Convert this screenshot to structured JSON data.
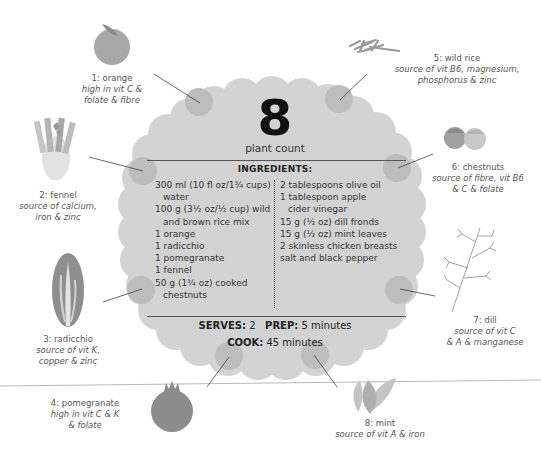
{
  "plant_count": {
    "number": "8",
    "label": "plant count"
  },
  "ingredients": {
    "title": "INGREDIENTS:",
    "left": [
      {
        "text": "300 ml (10 fl oz/1¾ cups)",
        "indent": false
      },
      {
        "text": "water",
        "indent": true
      },
      {
        "text": "100 g (3½ oz/½ cup) wild",
        "indent": false
      },
      {
        "text": "and brown rice mix",
        "indent": true
      },
      {
        "text": "1 orange",
        "indent": false
      },
      {
        "text": "1 radicchio",
        "indent": false
      },
      {
        "text": "1 pomegranate",
        "indent": false
      },
      {
        "text": "1 fennel",
        "indent": false
      },
      {
        "text": "50 g (1¾ oz) cooked",
        "indent": false
      },
      {
        "text": "chestnuts",
        "indent": true
      }
    ],
    "right": [
      {
        "text": "2 tablespoons olive oil",
        "indent": false
      },
      {
        "text": "1 tablespoon apple",
        "indent": false
      },
      {
        "text": "cider vinegar",
        "indent": true
      },
      {
        "text": "15 g (½ oz) dill fronds",
        "indent": false
      },
      {
        "text": "15 g (½ oz) mint leaves",
        "indent": false
      },
      {
        "text": "2 skinless chicken breasts",
        "indent": false
      },
      {
        "text": "salt and black pepper",
        "indent": false
      }
    ]
  },
  "meta": {
    "serves_label": "SERVES:",
    "serves_value": "2",
    "prep_label": "PREP:",
    "prep_value": "5 minutes",
    "cook_label": "COOK:",
    "cook_value": "45 minutes"
  },
  "plants": [
    {
      "name": "1: orange",
      "desc1": "high in vit C &",
      "desc2": "folate & fibre",
      "icon": "orange-icon"
    },
    {
      "name": "2: fennel",
      "desc1": "source of calcium,",
      "desc2": "iron & zinc",
      "icon": "fennel-icon"
    },
    {
      "name": "3: radicchio",
      "desc1": "source of vit K,",
      "desc2": "copper & zinc",
      "icon": "radicchio-icon"
    },
    {
      "name": "4: pomegranate",
      "desc1": "high in vit C & K",
      "desc2": "& folate",
      "icon": "pomegranate-icon"
    },
    {
      "name": "5: wild rice",
      "desc1": "source of vit B6, magnesium,",
      "desc2": "phosphorus & zinc",
      "icon": "wild-rice-icon"
    },
    {
      "name": "6: chestnuts",
      "desc1": "source of fibre, vit B6",
      "desc2": "& C & folate",
      "icon": "chestnuts-icon"
    },
    {
      "name": "7: dill",
      "desc1": "source of vit C",
      "desc2": "& A & manganese",
      "icon": "dill-icon"
    },
    {
      "name": "8: mint",
      "desc1": "source of vit A & iron",
      "desc2": "",
      "icon": "mint-icon"
    }
  ],
  "colors": {
    "blob": "#d3d3d3",
    "marker": "#bdbdbd",
    "text": "#333333",
    "illustration_dark": "#9a9a9a",
    "illustration_light": "#c8c8c8"
  }
}
